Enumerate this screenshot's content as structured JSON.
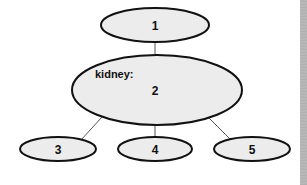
{
  "diagram": {
    "type": "concept-map",
    "nodes": [
      {
        "id": "1",
        "label": "1"
      },
      {
        "id": "2",
        "label": "2",
        "heading": "kidney:"
      },
      {
        "id": "3",
        "label": "3"
      },
      {
        "id": "4",
        "label": "4"
      },
      {
        "id": "5",
        "label": "5"
      }
    ],
    "edges": [
      {
        "from": "1",
        "to": "2"
      },
      {
        "from": "2",
        "to": "3"
      },
      {
        "from": "2",
        "to": "4"
      },
      {
        "from": "2",
        "to": "5"
      }
    ],
    "colors": {
      "node_fill": "#ececec",
      "node_stroke": "#111111",
      "edge": "#555555"
    }
  }
}
